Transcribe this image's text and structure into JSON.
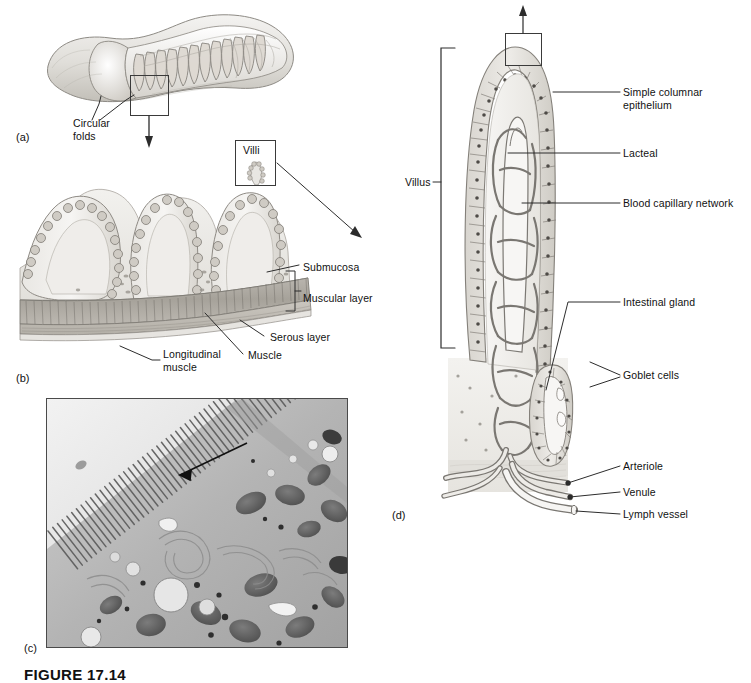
{
  "figure": {
    "caption": "FIGURE 17.14",
    "panels": [
      {
        "tag": "(a)",
        "x": 16,
        "y": 131,
        "description": "Segment of small intestine showing circular folds"
      },
      {
        "tag": "(b)",
        "x": 16,
        "y": 372,
        "description": "Enlarged section of intestinal wall showing villi and muscle layers"
      },
      {
        "tag": "(c)",
        "x": 24,
        "y": 642,
        "description": "Transmission electron micrograph of microvilli on intestinal epithelial cell"
      },
      {
        "tag": "(d)",
        "x": 392,
        "y": 509,
        "description": "Structure of a single villus with internal vessels"
      }
    ]
  },
  "panel_a": {
    "labels": [
      {
        "name": "circular-folds",
        "text": "Circular\nfolds",
        "x": 73,
        "y": 117
      }
    ],
    "callout_box": {
      "x": 130,
      "y": 75,
      "w": 39,
      "h": 41
    }
  },
  "panel_b": {
    "labels": [
      {
        "name": "submucosa",
        "text": "Submucosa",
        "x": 303,
        "y": 261
      },
      {
        "name": "muscular-layer",
        "text": "Muscular layer",
        "x": 303,
        "y": 292
      },
      {
        "name": "serous-layer",
        "text": "Serous layer",
        "x": 270,
        "y": 331
      },
      {
        "name": "muscle",
        "text": "Muscle",
        "x": 248,
        "y": 349
      },
      {
        "name": "longitudinal-muscle",
        "text": "Longitudinal\nmuscle",
        "x": 163,
        "y": 348
      }
    ],
    "villi_box": {
      "x": 235,
      "y": 140,
      "w": 41,
      "h": 46,
      "label": "Villi"
    }
  },
  "panel_c": {
    "frame": {
      "x": 46,
      "y": 398,
      "w": 302,
      "h": 250
    },
    "features": [
      "microvilli",
      "mitochondria",
      "endoplasmic-reticulum",
      "vesicles"
    ]
  },
  "panel_d": {
    "bracket_label": {
      "name": "villus",
      "text": "Villus",
      "x": 405,
      "y": 175
    },
    "callout_box": {
      "x": 505,
      "y": 33,
      "w": 37,
      "h": 33
    },
    "labels": [
      {
        "name": "simple-columnar-epithelium",
        "text": "Simple columnar\nepithelium",
        "x": 623,
        "y": 89
      },
      {
        "name": "lacteal",
        "text": "Lacteal",
        "x": 623,
        "y": 148
      },
      {
        "name": "blood-capillary-network",
        "text": "Blood capillary network",
        "x": 623,
        "y": 198
      },
      {
        "name": "intestinal-gland",
        "text": "Intestinal gland",
        "x": 623,
        "y": 297
      },
      {
        "name": "goblet-cells",
        "text": "Goblet cells",
        "x": 623,
        "y": 370
      },
      {
        "name": "arteriole",
        "text": "Arteriole",
        "x": 623,
        "y": 461
      },
      {
        "name": "venule",
        "text": "Venule",
        "x": 623,
        "y": 487
      },
      {
        "name": "lymph-vessel",
        "text": "Lymph vessel",
        "x": 623,
        "y": 509
      }
    ]
  },
  "colors": {
    "ink": "#111111",
    "leader_line": "#3a3a3a",
    "tissue_light": "#e8e6e2",
    "tissue_mid": "#c9c6c0",
    "tissue_dark": "#9a968f",
    "vessel": "#8d8a85",
    "micrograph_bg": "#b8b8b8"
  }
}
